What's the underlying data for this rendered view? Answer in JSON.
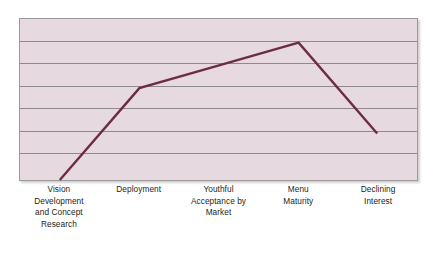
{
  "chart_data": {
    "type": "line",
    "title": "",
    "subtitle": "",
    "xlabel": "",
    "ylabel": "",
    "categories": [
      "Vision\nDevelopment\nand Concept\nResearch",
      "Deployment",
      "Youthful\nAcceptance by\nMarket",
      "Menu\nMaturity",
      "Declining\nInterest"
    ],
    "categories_flat": [
      "Vision Development and Concept Research",
      "Deployment",
      "Youthful Acceptance by Market",
      "Menu Maturity",
      "Declining Interest"
    ],
    "series": [
      {
        "name": "Lifecycle",
        "values": [
          0,
          4,
          5.3,
          6.6,
          2.9
        ]
      }
    ],
    "ylim": [
      0,
      7
    ],
    "y_tick_count": 8,
    "grid": true,
    "grid_axis": "y",
    "axis_tick_labels": [],
    "legend": false,
    "legend_position": "none",
    "annotations": [],
    "points_px": [
      {
        "label": "Vision Development and Concept Research",
        "x": 40,
        "y": 163
      },
      {
        "label": "Deployment",
        "x": 120,
        "y": 70
      },
      {
        "label": "Youthful Acceptance by Market",
        "x": 200,
        "y": 47
      },
      {
        "label": "Menu Maturity",
        "x": 280,
        "y": 24
      },
      {
        "label": "Declining Interest",
        "x": 359,
        "y": 116
      }
    ],
    "gridline_positions_pct": [
      13.5,
      27.5,
      41.5,
      55.5,
      69.5,
      83.5
    ],
    "colors": {
      "plot_background": "#e6dae0",
      "plot_border": "#9a9a9a",
      "gridline": "#8d8a8d",
      "series_line": "#6e2c44",
      "label_text": "#231f20",
      "canvas_background": "#ffffff"
    },
    "series_line_width": 2.4
  }
}
